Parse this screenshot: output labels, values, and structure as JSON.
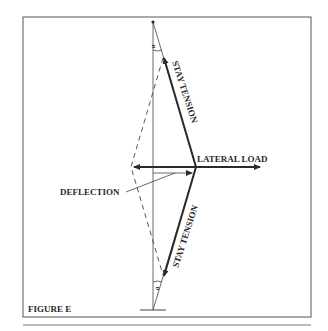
{
  "figure": {
    "caption": "FIGURE E",
    "labels": {
      "lateral_load": "LATERAL LOAD",
      "deflection": "DEFLECTION",
      "stay_tension_upper": "STAY TENSION",
      "stay_tension_lower": "STAY TENSION",
      "angle_upper": "a",
      "angle_lower": "a"
    },
    "colors": {
      "ink": "#2a2a2a",
      "frame": "#555555",
      "background": "#ffffff"
    }
  }
}
